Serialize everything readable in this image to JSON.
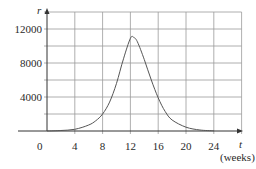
{
  "chart_data": {
    "type": "line",
    "title": "",
    "xlabel": "t",
    "xlabel_unit": "(weeks)",
    "ylabel": "r",
    "xlim": [
      0,
      28
    ],
    "ylim": [
      0,
      14000
    ],
    "grid": true,
    "legend": null,
    "x_ticks": [
      4,
      8,
      12,
      16,
      20,
      24
    ],
    "x_tick_labels": [
      "4",
      "8",
      "12",
      "16",
      "20",
      "24"
    ],
    "y_ticks": [
      4000,
      8000,
      12000
    ],
    "y_tick_labels": [
      "4000",
      "8000",
      "12000"
    ],
    "y_grid_step": 2000,
    "x_grid_step": 4,
    "origin_label": "0",
    "series": [
      {
        "name": "r(t)",
        "color": "#555555",
        "x": [
          0,
          2,
          4,
          6,
          7,
          8,
          9,
          10,
          11,
          12,
          12.5,
          13,
          14,
          15,
          16,
          17,
          18,
          20,
          22,
          24
        ],
        "values": [
          0,
          60,
          200,
          700,
          1200,
          2000,
          3400,
          5600,
          8500,
          10900,
          11000,
          10500,
          8400,
          6000,
          3900,
          2300,
          1300,
          450,
          120,
          20
        ]
      }
    ]
  }
}
